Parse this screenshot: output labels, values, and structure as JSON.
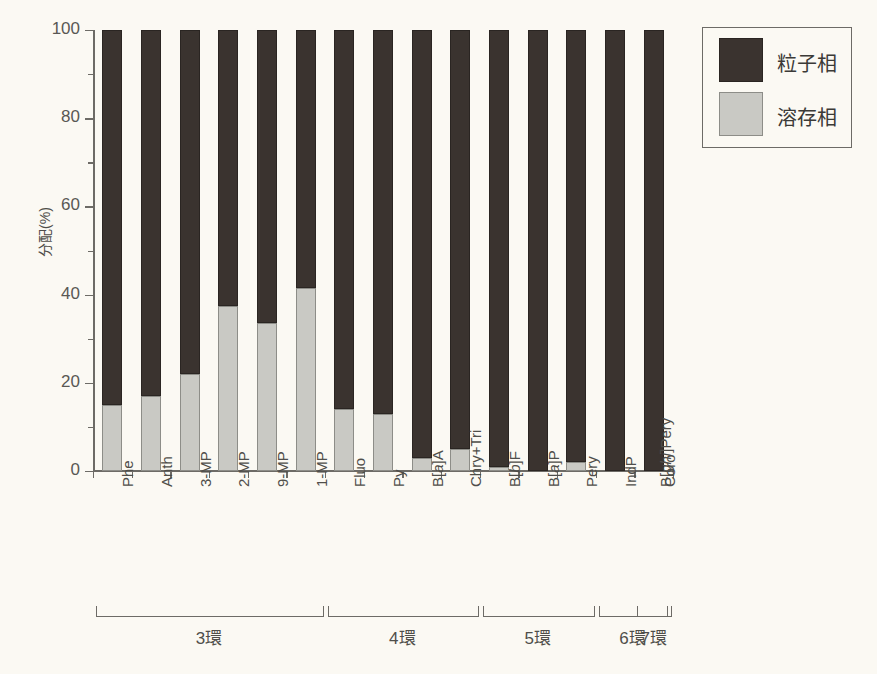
{
  "chart_data": {
    "type": "bar",
    "stacked": true,
    "title": "",
    "xlabel": "",
    "ylabel": "分配(%)",
    "ylim": [
      0,
      100
    ],
    "yticks": [
      0,
      20,
      40,
      60,
      80,
      100
    ],
    "ytick_labels": [
      "0",
      "20",
      "40",
      "60",
      "80",
      "100"
    ],
    "yminor_ticks": [
      10,
      30,
      50,
      70,
      90
    ],
    "grid": false,
    "legend_position": "top-right",
    "categories": [
      "Phe",
      "Anth",
      "3-MP",
      "2-MP",
      "9-MP",
      "1-MP",
      "Fluo",
      "Py",
      "B[a]A",
      "Chry+Tri",
      "B[b]F",
      "B[a]P",
      "Pery",
      "IndP",
      "B[ghi]Pery",
      "Coro"
    ],
    "categories_display": [
      {
        "text": "Phe",
        "italic_part": ""
      },
      {
        "text": "Anth",
        "italic_part": ""
      },
      {
        "text": "3-MP",
        "italic_part": ""
      },
      {
        "text": "2-MP",
        "italic_part": ""
      },
      {
        "text": "9-MP",
        "italic_part": ""
      },
      {
        "text": "1-MP",
        "italic_part": ""
      },
      {
        "text": "Fluo",
        "italic_part": ""
      },
      {
        "text": "Py",
        "italic_part": ""
      },
      {
        "text": "B[a]A",
        "italic_part": "a"
      },
      {
        "text": "Chry+Tri",
        "italic_part": ""
      },
      {
        "text": "B[b]F",
        "italic_part": "b"
      },
      {
        "text": "B[a]P",
        "italic_part": "a"
      },
      {
        "text": "Pery",
        "italic_part": ""
      },
      {
        "text": "IndP",
        "italic_part": ""
      },
      {
        "text": "B[ghi]Pery",
        "italic_part": "ghi"
      },
      {
        "text": "Coro",
        "italic_part": ""
      }
    ],
    "series": [
      {
        "name": "溶存相",
        "color": "#c9c9c4",
        "values": [
          15,
          17,
          22,
          37.5,
          33.5,
          41.5,
          14,
          13,
          3,
          5,
          1,
          0,
          2,
          0,
          0,
          0
        ]
      },
      {
        "name": "粒子相",
        "color": "#3a332f",
        "values": [
          85,
          83,
          78,
          62.5,
          66.5,
          58.5,
          86,
          87,
          97,
          95,
          99,
          100,
          98,
          100,
          100,
          100
        ]
      }
    ],
    "bar_count_drawn": 15,
    "groups": [
      {
        "label": "3環",
        "start": 0,
        "end": 5
      },
      {
        "label": "4環",
        "start": 6,
        "end": 9
      },
      {
        "label": "5環",
        "start": 10,
        "end": 12
      },
      {
        "label": "6環",
        "start": 13,
        "end": 14
      },
      {
        "label": "7環",
        "start": 15,
        "end": 15
      }
    ]
  },
  "legend": {
    "items": [
      {
        "label": "粒子相",
        "color": "#3a332f"
      },
      {
        "label": "溶存相",
        "color": "#c9c9c4"
      }
    ]
  },
  "colors": {
    "background": "#fbf9f3",
    "axis": "#6d6b66",
    "text": "#4f4e4a",
    "particle_phase": "#3a332f",
    "dissolved_phase": "#c9c9c4"
  }
}
